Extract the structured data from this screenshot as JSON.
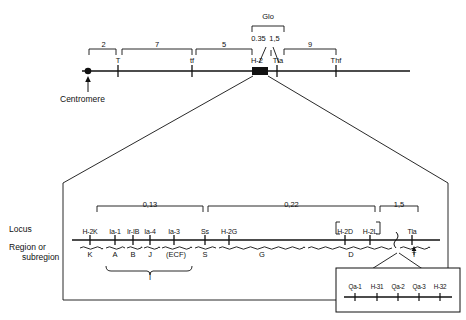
{
  "figure": {
    "centromere_label": "Centromere",
    "side_labels": {
      "locus": "Locus",
      "region": "Region or",
      "subregion": "subregion"
    }
  },
  "chromosome": {
    "markers": [
      {
        "label": "T",
        "x": 118
      },
      {
        "label": "tf",
        "x": 192
      },
      {
        "label": "H-2",
        "x": 257
      },
      {
        "label": "Tla",
        "x": 278
      },
      {
        "label": "Thf",
        "x": 336
      }
    ],
    "distances": [
      {
        "value": "2",
        "x1": 89,
        "x2": 118
      },
      {
        "value": "7",
        "x1": 122,
        "x2": 192
      },
      {
        "value": "5",
        "x1": 196,
        "x2": 252
      },
      {
        "value": "0.35",
        "x1": 252,
        "x2": 265
      },
      {
        "value": "1,5",
        "x1": 268,
        "x2": 281
      },
      {
        "value": "9",
        "x1": 284,
        "x2": 336
      }
    ],
    "glo_label": "Glo"
  },
  "expanded_map": {
    "distances": [
      {
        "value": "0,13",
        "x1": 97,
        "x2": 203
      },
      {
        "value": "0,22",
        "x1": 208,
        "x2": 375
      },
      {
        "value": "1,5",
        "x1": 380,
        "x2": 418
      }
    ],
    "loci": [
      {
        "label": "H-2K",
        "x": 90
      },
      {
        "label": "Ia-1",
        "x": 115
      },
      {
        "label": "Ir-IB",
        "x": 133
      },
      {
        "label": "Ia-4",
        "x": 150
      },
      {
        "label": "Ia-3",
        "x": 174
      },
      {
        "label": "Ss",
        "x": 205
      },
      {
        "label": "H-2G",
        "x": 229
      },
      {
        "label": "H-2D",
        "x": 345
      },
      {
        "label": "H-2L",
        "x": 370
      },
      {
        "label": "Tla",
        "x": 412
      }
    ],
    "bracketed_loci": [
      "H-2D",
      "H-2L"
    ],
    "regions": [
      {
        "label": "K",
        "x": 90,
        "x1": 80,
        "x2": 103
      },
      {
        "label": "A",
        "x": 115,
        "x1": 106,
        "x2": 125
      },
      {
        "label": "B",
        "x": 133,
        "x1": 127,
        "x2": 142
      },
      {
        "label": "J",
        "x": 150,
        "x1": 144,
        "x2": 160
      },
      {
        "label": "(ECF)",
        "x": 176,
        "x1": 162,
        "x2": 192
      },
      {
        "label": "S",
        "x": 205,
        "x1": 195,
        "x2": 216
      },
      {
        "label": "G",
        "x": 262,
        "x1": 219,
        "x2": 305
      },
      {
        "label": "D",
        "x": 351,
        "x1": 308,
        "x2": 392
      },
      {
        "label": "T",
        "x": 414,
        "x1": 400,
        "x2": 430
      }
    ],
    "super_region": {
      "label": "I",
      "x": 150,
      "x1": 106,
      "x2": 192
    }
  },
  "inset": {
    "loci": [
      {
        "label": "Qa-1",
        "x": 355
      },
      {
        "label": "H-31",
        "x": 377
      },
      {
        "label": "Qa-2",
        "x": 398
      },
      {
        "label": "Qa-3",
        "x": 419
      },
      {
        "label": "H-32",
        "x": 440
      }
    ]
  }
}
